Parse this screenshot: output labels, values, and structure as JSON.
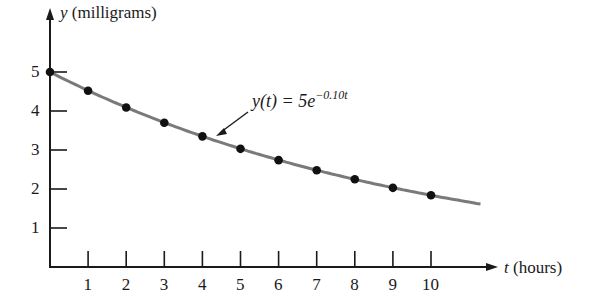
{
  "chart_data": {
    "type": "line",
    "title": "",
    "xlabel": "t (hours)",
    "ylabel": "y (milligrams)",
    "xlim": [
      0,
      11.5
    ],
    "ylim": [
      0,
      5.5
    ],
    "x_ticks": [
      1,
      2,
      3,
      4,
      5,
      6,
      7,
      8,
      9,
      10
    ],
    "y_ticks": [
      1,
      2,
      3,
      4,
      5
    ],
    "grid": false,
    "legend": null,
    "annotation": {
      "text_main": "y(t) = 5e",
      "text_exp": "−0.10t",
      "points_to_t": 4.3
    },
    "series": [
      {
        "name": "y(t) = 5e^(-0.10t)",
        "kind": "curve",
        "formula": "5*exp(-0.10*t)",
        "t_range": [
          0,
          11.3
        ],
        "color": "#7a7a7a"
      },
      {
        "name": "data points",
        "kind": "scatter",
        "color": "#111111",
        "x": [
          0,
          1,
          2,
          3,
          4,
          5,
          6,
          7,
          8,
          9,
          10
        ],
        "values": [
          5.0,
          4.52,
          4.09,
          3.7,
          3.35,
          3.03,
          2.74,
          2.48,
          2.25,
          2.03,
          1.84
        ]
      }
    ]
  },
  "labels": {
    "y_axis": {
      "var": "y",
      "unit": "(milligrams)"
    },
    "x_axis": {
      "var": "t",
      "unit": "(hours)"
    },
    "y_tick_labels": [
      "5",
      "4",
      "3",
      "2",
      "1"
    ],
    "x_tick_labels": [
      "1",
      "2",
      "3",
      "4",
      "5",
      "6",
      "7",
      "8",
      "9",
      "10"
    ],
    "annotation": {
      "main": "y(t) = 5e",
      "exp": "−0.10t"
    }
  }
}
